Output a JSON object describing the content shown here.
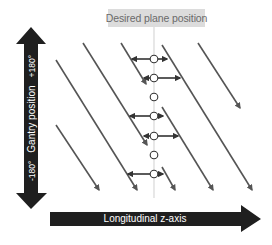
{
  "diagram": {
    "title_label": "Desired plane position",
    "vertical_axis": {
      "label": "Gantry position",
      "min_label": "-180°",
      "max_label": "+180°"
    },
    "horizontal_axis": {
      "label": "Longitudinal z-axis"
    },
    "colors": {
      "axis_arrow": "#1f1f1f",
      "helix_line": "#555555",
      "plane_line": "#d8d8d8",
      "label_bg": "#dcdcdc",
      "label_text": "#6a6a6a",
      "circle_fill": "#ffffff",
      "circle_stroke": "#333333"
    },
    "helix_segments": [
      {
        "x1": 56,
        "y1": 125,
        "x2": 99,
        "y2": 190
      },
      {
        "x1": 56,
        "y1": 60,
        "x2": 137,
        "y2": 190
      },
      {
        "x1": 83,
        "y1": 43,
        "x2": 147,
        "y2": 145
      },
      {
        "x1": 121,
        "y1": 43,
        "x2": 146,
        "y2": 84
      },
      {
        "x1": 162,
        "y1": 45,
        "x2": 252,
        "y2": 190
      },
      {
        "x1": 198,
        "y1": 43,
        "x2": 240,
        "y2": 108
      },
      {
        "x1": 162,
        "y1": 107,
        "x2": 213,
        "y2": 190
      },
      {
        "x1": 162,
        "y1": 167,
        "x2": 175,
        "y2": 190
      }
    ],
    "interpolation_points": [
      {
        "y": 59,
        "left_to": 132,
        "right_to": 167
      },
      {
        "y": 78,
        "left_to": 144,
        "right_to": 180
      },
      {
        "y": 97
      },
      {
        "y": 116,
        "left_to": 130,
        "right_to": 163
      },
      {
        "y": 136,
        "left_to": 144,
        "right_to": 178
      },
      {
        "y": 155
      },
      {
        "y": 174,
        "left_to": 128,
        "right_to": 163
      }
    ],
    "plane_x": 154
  }
}
